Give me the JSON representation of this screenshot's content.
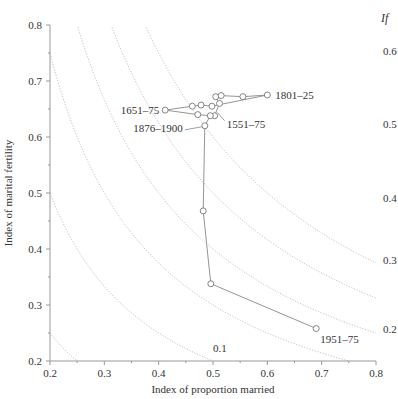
{
  "chart_data": {
    "type": "line",
    "title": "",
    "xlabel": "Index of proportion married",
    "ylabel": "Index of marital fertility",
    "xlim": [
      0.2,
      0.8
    ],
    "ylim": [
      0.2,
      0.8
    ],
    "x_ticks": [
      "0.2",
      "0.3",
      "0.4",
      "0.5",
      "0.6",
      "0.7",
      "0.8"
    ],
    "y_ticks": [
      "0.2",
      "0.3",
      "0.4",
      "0.5",
      "0.6",
      "0.7",
      "0.8"
    ],
    "grid": false,
    "iso_curves": {
      "label": "If",
      "levels": [
        0.1,
        0.2,
        0.3,
        0.4,
        0.5,
        0.6
      ],
      "style": "dotted"
    },
    "series": [
      {
        "name": "Ig by Im trajectory",
        "points": [
          {
            "x": 0.503,
            "y": 0.638,
            "label": "1551–75"
          },
          {
            "x": 0.512,
            "y": 0.66
          },
          {
            "x": 0.505,
            "y": 0.672
          },
          {
            "x": 0.515,
            "y": 0.674
          },
          {
            "x": 0.555,
            "y": 0.672
          },
          {
            "x": 0.6,
            "y": 0.675,
            "label": "1801–25"
          },
          {
            "x": 0.498,
            "y": 0.655
          },
          {
            "x": 0.478,
            "y": 0.657
          },
          {
            "x": 0.462,
            "y": 0.655
          },
          {
            "x": 0.412,
            "y": 0.648,
            "label": "1651–75"
          },
          {
            "x": 0.472,
            "y": 0.64
          },
          {
            "x": 0.495,
            "y": 0.638
          },
          {
            "x": 0.485,
            "y": 0.62,
            "label": "1876–1900"
          },
          {
            "x": 0.482,
            "y": 0.468
          },
          {
            "x": 0.496,
            "y": 0.338
          },
          {
            "x": 0.69,
            "y": 0.258,
            "label": "1951–75"
          }
        ]
      }
    ],
    "annotations": [
      "1801–25",
      "1651–75",
      "1551–75",
      "1876–1900",
      "1951–75",
      "If",
      "0.1",
      "0.2",
      "0.3",
      "0.4",
      "0.5",
      "0.6"
    ]
  }
}
